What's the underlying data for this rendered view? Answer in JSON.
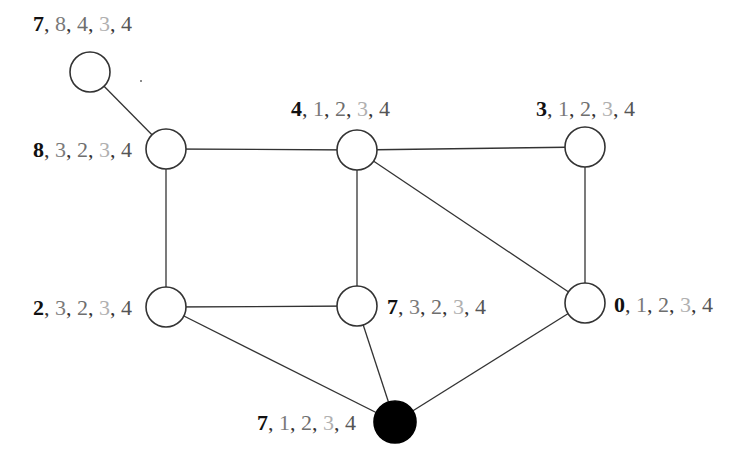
{
  "diagram": {
    "type": "graph",
    "nodes": [
      {
        "id": "n_top_left",
        "x": 90,
        "y": 72,
        "r": 20,
        "filled": false,
        "label": [
          "7",
          "8",
          "4",
          "3",
          "4"
        ]
      },
      {
        "id": "n_upper_left",
        "x": 166,
        "y": 149,
        "r": 20,
        "filled": false,
        "label": [
          "8",
          "3",
          "2",
          "3",
          "4"
        ]
      },
      {
        "id": "n_upper_mid",
        "x": 357,
        "y": 150,
        "r": 20,
        "filled": false,
        "label": [
          "4",
          "1",
          "2",
          "3",
          "4"
        ]
      },
      {
        "id": "n_upper_right",
        "x": 585,
        "y": 147,
        "r": 20,
        "filled": false,
        "label": [
          "3",
          "1",
          "2",
          "3",
          "4"
        ]
      },
      {
        "id": "n_lower_left",
        "x": 166,
        "y": 307,
        "r": 20,
        "filled": false,
        "label": [
          "2",
          "3",
          "2",
          "3",
          "4"
        ]
      },
      {
        "id": "n_lower_mid",
        "x": 357,
        "y": 306,
        "r": 20,
        "filled": false,
        "label": [
          "7",
          "3",
          "2",
          "3",
          "4"
        ]
      },
      {
        "id": "n_lower_right",
        "x": 585,
        "y": 303,
        "r": 20,
        "filled": false,
        "label": [
          "0",
          "1",
          "2",
          "3",
          "4"
        ]
      },
      {
        "id": "n_bottom",
        "x": 395,
        "y": 422,
        "r": 21,
        "filled": true,
        "label": [
          "7",
          "1",
          "2",
          "3",
          "4"
        ]
      }
    ],
    "edges": [
      [
        "n_top_left",
        "n_upper_left"
      ],
      [
        "n_upper_left",
        "n_upper_mid"
      ],
      [
        "n_upper_mid",
        "n_upper_right"
      ],
      [
        "n_upper_left",
        "n_lower_left"
      ],
      [
        "n_upper_mid",
        "n_lower_mid"
      ],
      [
        "n_upper_mid",
        "n_lower_right"
      ],
      [
        "n_upper_right",
        "n_lower_right"
      ],
      [
        "n_lower_left",
        "n_lower_mid"
      ],
      [
        "n_lower_left",
        "n_bottom"
      ],
      [
        "n_lower_mid",
        "n_bottom"
      ],
      [
        "n_lower_right",
        "n_bottom"
      ]
    ],
    "labels": {
      "top_left": {
        "v0": "7",
        "v1": "8",
        "v2": "4",
        "v3": "3",
        "v4": "4"
      },
      "upper_left": {
        "v0": "8",
        "v1": "3",
        "v2": "2",
        "v3": "3",
        "v4": "4"
      },
      "upper_mid": {
        "v0": "4",
        "v1": "1",
        "v2": "2",
        "v3": "3",
        "v4": "4"
      },
      "upper_right": {
        "v0": "3",
        "v1": "1",
        "v2": "2",
        "v3": "3",
        "v4": "4"
      },
      "lower_left": {
        "v0": "2",
        "v1": "3",
        "v2": "2",
        "v3": "3",
        "v4": "4"
      },
      "lower_mid": {
        "v0": "7",
        "v1": "3",
        "v2": "2",
        "v3": "3",
        "v4": "4"
      },
      "lower_right": {
        "v0": "0",
        "v1": "1",
        "v2": "2",
        "v3": "3",
        "v4": "4"
      },
      "bottom": {
        "v0": "7",
        "v1": "1",
        "v2": "2",
        "v3": "3",
        "v4": "4"
      }
    },
    "separator": ", ",
    "colors": {
      "edge": "#333333",
      "node_stroke": "#333333",
      "node_fill": "#ffffff",
      "filled_node": "#000000",
      "label_primary": "#111111",
      "label_secondary": "#7a7a7a",
      "label_tertiary": "#b0b0b0"
    }
  }
}
